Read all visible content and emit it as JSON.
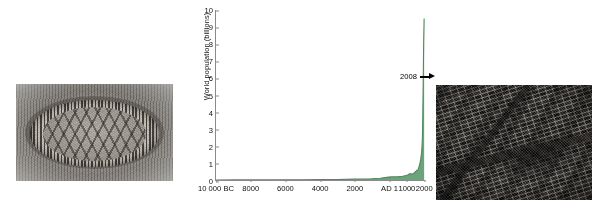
{
  "figure": {
    "left_photo": {
      "name": "ancient-settlement-photo",
      "caption": "Grayscale illustration of an ancient circular palisaded settlement with rows of huts"
    },
    "right_photo": {
      "name": "modern-city-aerial-photo",
      "caption": "Dark aerial photograph of a dense modern urban housing grid"
    }
  },
  "chart_data": {
    "type": "area",
    "title": "",
    "xlabel": "",
    "ylabel": "World population (billions)",
    "ylim": [
      0,
      10
    ],
    "grid": false,
    "legend": "none",
    "line_color": "#4e8a5e",
    "fill_color": "#6ba47a",
    "axis_color": "#8a8a8a",
    "y_ticks": [
      "0",
      "1",
      "2",
      "3",
      "4",
      "5",
      "6",
      "7",
      "8",
      "9",
      "10"
    ],
    "y_tick_values": [
      0,
      1,
      2,
      3,
      4,
      5,
      6,
      7,
      8,
      9,
      10
    ],
    "x_ticks": [
      "10 000 BC",
      "8000",
      "6000",
      "4000",
      "2000",
      "AD 1",
      "1000",
      "2000"
    ],
    "x_tick_years": [
      -10000,
      -8000,
      -6000,
      -4000,
      -2000,
      1,
      1000,
      2000
    ],
    "xlim": [
      -10000,
      2100
    ],
    "annotations": [
      {
        "label": "2008",
        "icon": "right-arrow",
        "year": 2008,
        "value": 6.7
      }
    ],
    "x": [
      -10000,
      -9000,
      -8000,
      -7000,
      -6000,
      -5000,
      -4000,
      -3000,
      -2000,
      -1000,
      -500,
      1,
      200,
      400,
      600,
      800,
      1000,
      1100,
      1200,
      1300,
      1400,
      1500,
      1600,
      1700,
      1750,
      1800,
      1850,
      1900,
      1927,
      1950,
      1960,
      1974,
      1987,
      1999,
      2008,
      2011,
      2025,
      2050
    ],
    "y": [
      0.004,
      0.005,
      0.006,
      0.007,
      0.01,
      0.015,
      0.02,
      0.03,
      0.05,
      0.07,
      0.1,
      0.17,
      0.19,
      0.19,
      0.2,
      0.22,
      0.26,
      0.3,
      0.36,
      0.36,
      0.35,
      0.44,
      0.55,
      0.6,
      0.77,
      0.95,
      1.2,
      1.6,
      2.0,
      2.5,
      3.0,
      4.0,
      5.0,
      6.0,
      6.7,
      7.0,
      8.2,
      9.5
    ]
  }
}
